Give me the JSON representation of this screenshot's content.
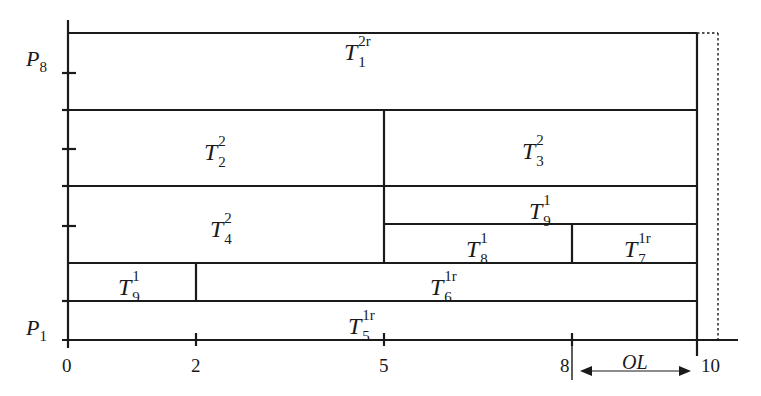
{
  "diagram": {
    "y_axis": {
      "top_label": {
        "base": "P",
        "sub": "8"
      },
      "bottom_label": {
        "base": "P",
        "sub": "1"
      }
    },
    "x_axis": {
      "ticks": [
        "0",
        "2",
        "5",
        "8",
        "10"
      ],
      "overlap_label": "OL"
    },
    "tasks": [
      {
        "id": "t1",
        "base": "T",
        "sub": "1",
        "sup": "2r"
      },
      {
        "id": "t2",
        "base": "T",
        "sub": "2",
        "sup": "2"
      },
      {
        "id": "t3",
        "base": "T",
        "sub": "3",
        "sup": "2"
      },
      {
        "id": "t4",
        "base": "T",
        "sub": "4",
        "sup": "2"
      },
      {
        "id": "t9a",
        "base": "T",
        "sub": "9",
        "sup": "1"
      },
      {
        "id": "t8",
        "base": "T",
        "sub": "8",
        "sup": "1"
      },
      {
        "id": "t7",
        "base": "T",
        "sub": "7",
        "sup": "1r"
      },
      {
        "id": "t9b",
        "base": "T",
        "sub": "9",
        "sup": "1"
      },
      {
        "id": "t6",
        "base": "T",
        "sub": "6",
        "sup": "1r"
      },
      {
        "id": "t5",
        "base": "T",
        "sub": "5",
        "sup": "1r"
      }
    ],
    "colors": {
      "line": "#1a1a1a",
      "background": "#ffffff"
    }
  }
}
